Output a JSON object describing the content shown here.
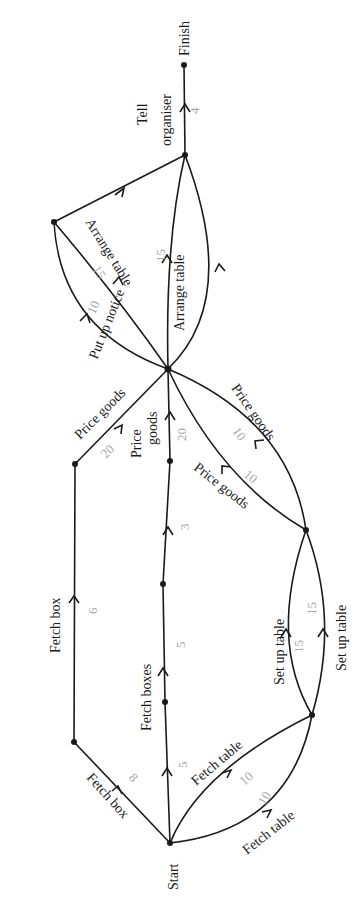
{
  "diagram": {
    "type": "activity-network",
    "orientation": "rotated-90",
    "nodes": {
      "start": {
        "label": "Start"
      },
      "finish": {
        "label": "Finish"
      }
    },
    "edges": [
      {
        "id": "fetch_box_1",
        "label": "Fetch box",
        "weight": "8"
      },
      {
        "id": "fetch_box_2",
        "label": "Fetch box",
        "weight": "6"
      },
      {
        "id": "price_goods_1",
        "label": "Price goods",
        "weight": "20"
      },
      {
        "id": "fetch_boxes_a",
        "label": "Fetch boxes",
        "weight": "5"
      },
      {
        "id": "fetch_boxes_b",
        "label": "",
        "weight": "5"
      },
      {
        "id": "fetch_boxes_c",
        "label": "",
        "weight": "3"
      },
      {
        "id": "price_goods_2",
        "label": "Price goods",
        "weight": "20"
      },
      {
        "id": "fetch_table_1",
        "label": "Fetch table",
        "weight": "10"
      },
      {
        "id": "fetch_table_2",
        "label": "Fetch table",
        "weight": "10"
      },
      {
        "id": "set_up_table_1",
        "label": "Set up table",
        "weight": "15"
      },
      {
        "id": "set_up_table_2",
        "label": "Set up table",
        "weight": "15"
      },
      {
        "id": "price_goods_3",
        "label": "Price goods",
        "weight": "10"
      },
      {
        "id": "price_goods_4",
        "label": "Price goods",
        "weight": "10"
      },
      {
        "id": "put_up_notice_1",
        "label": "Put up notice",
        "weight": "10"
      },
      {
        "id": "put_up_notice_2",
        "label": "Put up notice",
        "weight": "10"
      },
      {
        "id": "arrange_table_1",
        "label": "Arrange table",
        "weight": "15"
      },
      {
        "id": "arrange_table_2",
        "label": "Arrange table",
        "weight": "15"
      },
      {
        "id": "dummy_notice",
        "label": "",
        "weight": ""
      },
      {
        "id": "tell_organiser",
        "label": "Tell organiser",
        "label_line1": "Tell",
        "label_line2": "organiser",
        "weight": "4"
      }
    ]
  }
}
